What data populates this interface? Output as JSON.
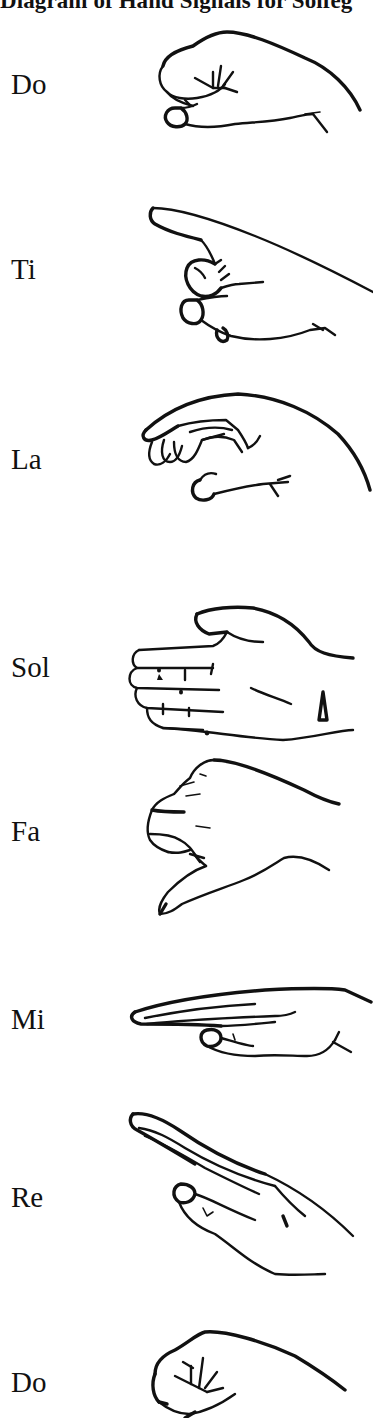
{
  "title": "Diagram of Hand Signals for Solfeg",
  "signals": [
    {
      "syllable": "Do",
      "hand_icon": "fist-hand-icon"
    },
    {
      "syllable": "Ti",
      "hand_icon": "pointing-hand-icon"
    },
    {
      "syllable": "La",
      "hand_icon": "drooping-hand-icon"
    },
    {
      "syllable": "Sol",
      "hand_icon": "flat-vertical-hand-icon"
    },
    {
      "syllable": "Fa",
      "hand_icon": "thumb-down-hand-icon"
    },
    {
      "syllable": "Mi",
      "hand_icon": "flat-horizontal-hand-icon"
    },
    {
      "syllable": "Re",
      "hand_icon": "angled-up-hand-icon"
    },
    {
      "syllable": "Do",
      "hand_icon": "fist-hand-icon"
    }
  ],
  "colors": {
    "ink": "#111111",
    "background": "#ffffff"
  }
}
